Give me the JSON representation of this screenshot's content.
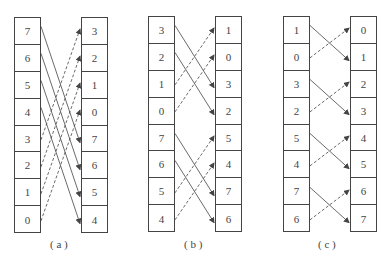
{
  "panels": [
    {
      "caption": "( a )",
      "left": [
        "7",
        "6",
        "5",
        "4",
        "3",
        "2",
        "1",
        "0"
      ],
      "right": [
        "3",
        "2",
        "1",
        "0",
        "7",
        "6",
        "5",
        "4"
      ],
      "solid": [
        [
          0,
          4
        ],
        [
          1,
          5
        ],
        [
          2,
          6
        ],
        [
          3,
          7
        ]
      ],
      "dashed": [
        [
          4,
          0
        ],
        [
          5,
          1
        ],
        [
          6,
          2
        ],
        [
          7,
          3
        ]
      ]
    },
    {
      "caption": "( b )",
      "left": [
        "3",
        "2",
        "1",
        "0",
        "7",
        "6",
        "5",
        "4"
      ],
      "right": [
        "1",
        "0",
        "3",
        "2",
        "5",
        "4",
        "7",
        "6"
      ],
      "solid": [
        [
          0,
          2
        ],
        [
          1,
          3
        ],
        [
          4,
          6
        ],
        [
          5,
          7
        ]
      ],
      "dashed": [
        [
          2,
          0
        ],
        [
          3,
          1
        ],
        [
          6,
          4
        ],
        [
          7,
          5
        ]
      ]
    },
    {
      "caption": "( c )",
      "left": [
        "1",
        "0",
        "3",
        "2",
        "5",
        "4",
        "7",
        "6"
      ],
      "right": [
        "0",
        "1",
        "2",
        "3",
        "4",
        "5",
        "6",
        "7"
      ],
      "solid": [
        [
          0,
          1
        ],
        [
          2,
          3
        ],
        [
          4,
          5
        ],
        [
          6,
          7
        ]
      ],
      "dashed": [
        [
          1,
          0
        ],
        [
          3,
          2
        ],
        [
          5,
          4
        ],
        [
          7,
          6
        ]
      ]
    }
  ],
  "colors": {
    "line": "#444444",
    "text": "#444444"
  }
}
